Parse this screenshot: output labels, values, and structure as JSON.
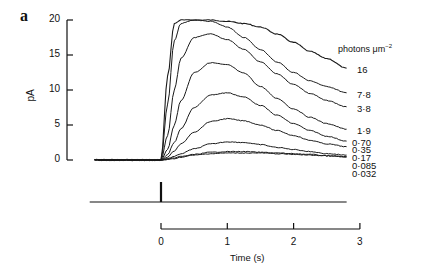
{
  "figure": {
    "panel_label": "a",
    "units_label": "photons μm",
    "units_exp": "−2"
  },
  "chart_data": {
    "type": "line",
    "title": "",
    "panel": "a",
    "xlabel": "Time (s)",
    "ylabel": "pA",
    "xlim": [
      -1.0,
      3.0
    ],
    "ylim": [
      0,
      20
    ],
    "x_ticks": [
      0,
      1,
      2,
      3
    ],
    "y_ticks": [
      0,
      5,
      10,
      15,
      20
    ],
    "grid": false,
    "legend_title": "photons μm⁻²",
    "legend_position": "right, labels at trace ends",
    "x": [
      -1.0,
      0.0,
      0.1,
      0.2,
      0.3,
      0.5,
      0.75,
      1.0,
      1.25,
      1.5,
      1.75,
      2.0,
      2.25,
      2.5,
      2.8
    ],
    "series": [
      {
        "name": "16",
        "values": [
          0,
          0,
          12.0,
          19.5,
          20.0,
          20.0,
          20.0,
          19.8,
          19.5,
          19.0,
          18.0,
          16.8,
          15.5,
          14.5,
          13.1
        ]
      },
      {
        "name": "7.8",
        "values": [
          0,
          0,
          8.0,
          17.0,
          19.5,
          20.0,
          19.8,
          19.0,
          17.5,
          15.8,
          14.0,
          12.5,
          11.3,
          10.5,
          9.6
        ]
      },
      {
        "name": "3.8",
        "values": [
          0,
          0,
          3.5,
          10.0,
          14.5,
          17.5,
          18.0,
          17.2,
          15.8,
          14.0,
          12.3,
          10.8,
          9.5,
          8.5,
          7.6
        ]
      },
      {
        "name": "1.9",
        "values": [
          0,
          0,
          1.5,
          5.0,
          8.5,
          12.5,
          13.9,
          13.6,
          12.4,
          10.5,
          8.8,
          7.3,
          6.1,
          5.2,
          4.4
        ]
      },
      {
        "name": "0.70",
        "values": [
          0,
          0,
          0.8,
          2.5,
          4.5,
          7.5,
          9.3,
          9.6,
          9.0,
          7.8,
          6.4,
          5.2,
          4.2,
          3.4,
          2.7
        ]
      },
      {
        "name": "0.35",
        "values": [
          0,
          0,
          0.4,
          1.3,
          2.3,
          4.0,
          5.5,
          5.9,
          5.6,
          5.0,
          4.2,
          3.5,
          2.8,
          2.3,
          1.9
        ]
      },
      {
        "name": "0.17",
        "values": [
          0,
          0,
          0.2,
          0.5,
          0.9,
          1.6,
          2.3,
          2.6,
          2.5,
          2.2,
          1.8,
          1.5,
          1.2,
          0.9,
          0.7
        ]
      },
      {
        "name": "0.085",
        "values": [
          0,
          0,
          0.1,
          0.3,
          0.5,
          0.8,
          1.1,
          1.2,
          1.2,
          1.1,
          1.0,
          0.9,
          0.8,
          0.6,
          0.5
        ]
      },
      {
        "name": "0.032",
        "values": [
          0,
          0,
          0.05,
          0.2,
          0.4,
          0.7,
          0.9,
          1.0,
          1.0,
          1.0,
          0.9,
          0.8,
          0.7,
          0.6,
          0.4
        ]
      }
    ],
    "label_offsets_px": [
      68,
      93,
      107,
      129,
      141,
      148,
      156,
      164,
      172
    ],
    "stimulus": {
      "description": "flash monitor trace",
      "flash_time_s": 0,
      "x_range": [
        -1.0,
        2.8
      ]
    }
  }
}
